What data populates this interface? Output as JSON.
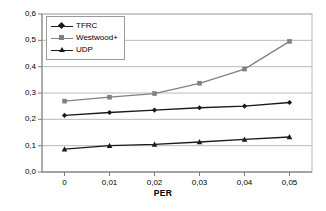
{
  "chart_data": {
    "type": "line",
    "title": "",
    "xlabel": "PER",
    "ylabel": "",
    "x": [
      0,
      0.01,
      0.02,
      0.03,
      0.04,
      0.05
    ],
    "xtick_labels": [
      "0",
      "0,01",
      "0,02",
      "0,03",
      "0,04",
      "0,05"
    ],
    "ytick_labels": [
      "0,0",
      "0,1",
      "0,2",
      "0,3",
      "0,4",
      "0,5",
      "0,6"
    ],
    "ytick_values": [
      0.0,
      0.1,
      0.2,
      0.3,
      0.4,
      0.5,
      0.6
    ],
    "ylim": [
      0.0,
      0.6
    ],
    "xlim": [
      -0.005,
      0.055
    ],
    "grid": "horizontal",
    "legend_position": "top-left-inside",
    "series": [
      {
        "name": "TFRC",
        "marker": "diamond",
        "color": "#1a1a1a",
        "values": [
          0.215,
          0.226,
          0.235,
          0.244,
          0.25,
          0.264
        ]
      },
      {
        "name": "Westwood+",
        "marker": "square",
        "color": "#808080",
        "values": [
          0.269,
          0.284,
          0.298,
          0.337,
          0.391,
          0.496
        ]
      },
      {
        "name": "UDP",
        "marker": "triangle",
        "color": "#1a1a1a",
        "values": [
          0.087,
          0.1,
          0.105,
          0.114,
          0.124,
          0.133
        ]
      }
    ]
  }
}
